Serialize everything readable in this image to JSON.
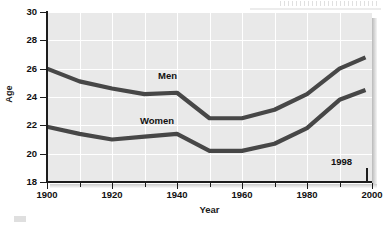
{
  "chart_data": {
    "type": "line",
    "title": "",
    "xlabel": "Year",
    "ylabel": "Age",
    "xlim": [
      1900,
      2000
    ],
    "ylim": [
      18,
      30
    ],
    "grid": true,
    "legend_position": "inline-series-labels",
    "x_ticks_major": [
      1900,
      1920,
      1940,
      1960,
      1980,
      2000
    ],
    "x_ticks_minor": [
      1910,
      1930,
      1950,
      1970,
      1990
    ],
    "y_ticks": [
      18,
      20,
      22,
      24,
      26,
      28,
      30
    ],
    "x_tick_labels": [
      "1900",
      "1920",
      "1940",
      "1960",
      "1980",
      "2000"
    ],
    "y_tick_labels": [
      "18",
      "20",
      "22",
      "24",
      "26",
      "28",
      "30"
    ],
    "x": [
      1900,
      1910,
      1920,
      1930,
      1940,
      1950,
      1960,
      1970,
      1980,
      1990,
      1998
    ],
    "series": [
      {
        "name": "Men",
        "color": "#474747",
        "values": [
          26.0,
          25.1,
          24.6,
          24.2,
          24.3,
          22.5,
          22.5,
          23.1,
          24.2,
          26.0,
          26.8
        ]
      },
      {
        "name": "Women",
        "color": "#474747",
        "values": [
          21.9,
          21.4,
          21.0,
          21.2,
          21.4,
          20.2,
          20.2,
          20.7,
          21.8,
          23.8,
          24.5
        ]
      }
    ],
    "annotations": [
      {
        "text": "1998",
        "x": 1998,
        "y": 19.0,
        "pointer": true
      }
    ]
  },
  "colors": {
    "panel_background": "#e9e9e9",
    "gridline": "#ffffff",
    "axis": "#1d1d1d",
    "series_line": "#474747",
    "text": "#111111",
    "page_background": "#ffffff"
  }
}
